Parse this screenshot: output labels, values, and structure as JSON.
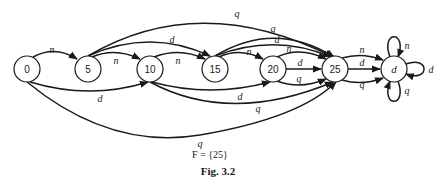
{
  "diagram": {
    "states": [
      {
        "id": "s0",
        "label": "0",
        "cx": 27,
        "cy": 69
      },
      {
        "id": "s5",
        "label": "5",
        "cx": 88,
        "cy": 69
      },
      {
        "id": "s10",
        "label": "10",
        "cx": 150,
        "cy": 69
      },
      {
        "id": "s15",
        "label": "15",
        "cx": 215,
        "cy": 69
      },
      {
        "id": "s20",
        "label": "20",
        "cx": 273,
        "cy": 69
      },
      {
        "id": "s25",
        "label": "25",
        "cx": 335,
        "cy": 69
      },
      {
        "id": "sd",
        "label": "d",
        "cx": 394,
        "cy": 69
      }
    ],
    "transitions": [
      {
        "from": "0",
        "to": "5",
        "symbol": "n"
      },
      {
        "from": "0",
        "to": "10",
        "symbol": "d"
      },
      {
        "from": "0",
        "to": "25",
        "symbol": "q"
      },
      {
        "from": "5",
        "to": "10",
        "symbol": "n"
      },
      {
        "from": "5",
        "to": "15",
        "symbol": "d"
      },
      {
        "from": "5",
        "to": "25",
        "symbol": "q"
      },
      {
        "from": "10",
        "to": "15",
        "symbol": "n"
      },
      {
        "from": "10",
        "to": "20",
        "symbol": "d"
      },
      {
        "from": "10",
        "to": "25",
        "symbol": "q"
      },
      {
        "from": "15",
        "to": "20",
        "symbol": "n"
      },
      {
        "from": "15",
        "to": "25",
        "symbol": "d"
      },
      {
        "from": "15",
        "to": "25",
        "symbol": "q"
      },
      {
        "from": "20",
        "to": "25",
        "symbol": "n"
      },
      {
        "from": "20",
        "to": "25",
        "symbol": "d"
      },
      {
        "from": "20",
        "to": "25",
        "symbol": "q"
      },
      {
        "from": "25",
        "to": "d",
        "symbol": "n"
      },
      {
        "from": "25",
        "to": "d",
        "symbol": "d"
      },
      {
        "from": "25",
        "to": "d",
        "symbol": "q"
      },
      {
        "from": "d",
        "to": "d",
        "symbol": "n"
      },
      {
        "from": "d",
        "to": "d",
        "symbol": "d"
      },
      {
        "from": "d",
        "to": "d",
        "symbol": "q"
      }
    ],
    "edge_labels": {
      "e0_5": "n",
      "e0_10": "d",
      "e0_25": "q",
      "e5_10": "n",
      "e5_15": "d",
      "e5_25": "q",
      "e10_15": "n",
      "e10_20": "d",
      "e10_25": "q",
      "e15_20": "n",
      "e15_25d": "d",
      "e15_25q": "q",
      "e20_25n": "n",
      "e20_25d": "d",
      "e20_25q": "q",
      "e25_dn": "n",
      "e25_dd": "d",
      "e25_dq": "q",
      "edd_n": "n",
      "edd_d": "d",
      "edd_q": "q"
    },
    "final_states": "F = {25}",
    "figure_caption": "Fig. 3.2"
  },
  "labels": {
    "s0": "0",
    "s5": "5",
    "s10": "10",
    "s15": "15",
    "s20": "20",
    "s25": "25",
    "sd": "d"
  }
}
